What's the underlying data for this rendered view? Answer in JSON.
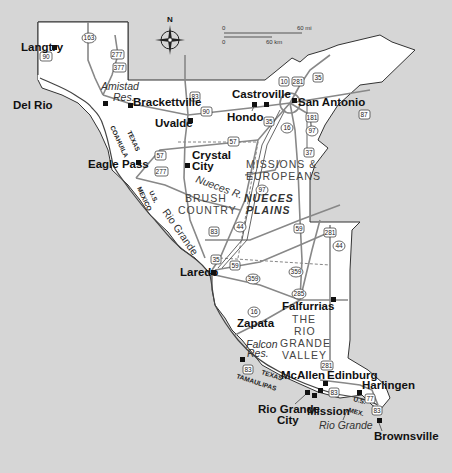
{
  "map": {
    "compass": {
      "label": "N"
    },
    "scale": {
      "miles_start": "0",
      "miles_end": "60 mi",
      "km_start": "0",
      "km_end": "60 km"
    },
    "cities": [
      {
        "name": "Langtry"
      },
      {
        "name": "Del Rio"
      },
      {
        "name": "Brackettville"
      },
      {
        "name": "Uvalde"
      },
      {
        "name": "Castroville"
      },
      {
        "name": "Hondo"
      },
      {
        "name": "San Antonio"
      },
      {
        "name": "Eagle Pass"
      },
      {
        "name": "Crystal"
      },
      {
        "name": "City"
      },
      {
        "name": "Laredo"
      },
      {
        "name": "Falfurrias"
      },
      {
        "name": "Zapata"
      },
      {
        "name": "McAllen"
      },
      {
        "name": "Edinburg"
      },
      {
        "name": "Harlingen"
      },
      {
        "name": "Rio Grande"
      },
      {
        "name": "City"
      },
      {
        "name": "Mission"
      },
      {
        "name": "Brownsville"
      }
    ],
    "water_labels": {
      "amistad1": "Amistad",
      "amistad2": "Res.",
      "nueces": "Nueces R.",
      "rio_grande_upper": "Rio Grande",
      "falcon1": "Falcon",
      "falcon2": "Res.",
      "rio_grande_lower": "Rio Grande"
    },
    "regions": {
      "missions1": "MISSIONS &",
      "missions2": "EUROPEANS",
      "brush1": "BRUSH",
      "brush2": "COUNTRY",
      "nueces1": "NUECES",
      "nueces2": "PLAINS",
      "rgv1": "THE",
      "rgv2": "RIO",
      "rgv3": "GRANDE",
      "rgv4": "VALLEY"
    },
    "border_labels": {
      "texas_upper": "TEXAS",
      "coahuila": "COAHUILA",
      "us_upper": "U.S.",
      "mexico_upper": "MEXICO",
      "texas_lower": "TEXAS",
      "tamaulipas": "TAMAULIPAS",
      "us_lower": "U.S.",
      "mex_lower": "MEX."
    },
    "highways": {
      "h90a": "90",
      "h163": "163",
      "h277a": "277",
      "h377": "377",
      "h83a": "83",
      "h90b": "90",
      "h10": "10",
      "h281a": "281",
      "h35a": "35",
      "h35b": "35",
      "h16a": "16",
      "h181": "181",
      "h87": "87",
      "h97a": "97",
      "h37": "37",
      "h57a": "57",
      "h57b": "57",
      "h277b": "277",
      "h97b": "97",
      "h83b": "83",
      "h44a": "44",
      "h59a": "59",
      "h281b": "281",
      "h44b": "44",
      "h35c": "35",
      "h59b": "59",
      "h359a": "359",
      "h359b": "359",
      "h285": "285",
      "h16b": "16",
      "h281c": "281",
      "h83c": "83",
      "h83d": "83",
      "h77": "77",
      "h83e": "83"
    }
  }
}
